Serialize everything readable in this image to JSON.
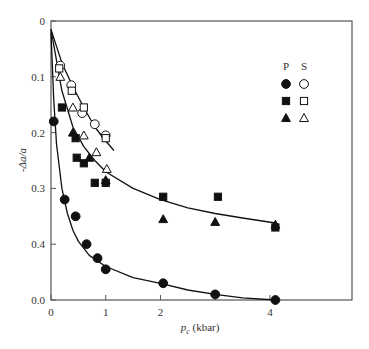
{
  "chart_data": {
    "type": "scatter",
    "title": "",
    "xlabel": "p_c (kbar)",
    "xlabel_main": "p",
    "xlabel_sub": "c",
    "xlabel_unit": " (kbar)",
    "ylabel": "-Δa/a",
    "xlim": [
      0,
      5.5
    ],
    "ylim": [
      0,
      0.5
    ],
    "y_inverted": true,
    "grid": false,
    "x_ticks": [
      0,
      1,
      2,
      3,
      4
    ],
    "x_tick_labels": [
      "0",
      "1",
      "2",
      "",
      "4"
    ],
    "y_ticks": [
      0,
      0.1,
      0.2,
      0.3,
      0.4,
      0.5
    ],
    "y_tick_labels": [
      "0",
      "0.1",
      "0.2",
      "0.3",
      "0.4",
      "0.0"
    ],
    "legend": {
      "position": "upper right",
      "columns": [
        "P",
        "S"
      ],
      "rows": [
        "circle",
        "square",
        "triangle"
      ]
    },
    "series": [
      {
        "name": "P circle",
        "marker": "circle",
        "filled": true,
        "x": [
          0.05,
          0.25,
          0.45,
          0.65,
          0.85,
          1.0,
          2.05,
          3.0,
          4.1
        ],
        "y": [
          0.18,
          0.32,
          0.35,
          0.4,
          0.425,
          0.445,
          0.47,
          0.49,
          0.5
        ]
      },
      {
        "name": "P square",
        "marker": "square",
        "filled": true,
        "x": [
          0.2,
          0.45,
          0.47,
          0.6,
          0.8,
          1.0,
          2.05,
          3.05,
          4.1
        ],
        "y": [
          0.155,
          0.21,
          0.245,
          0.255,
          0.29,
          0.29,
          0.315,
          0.315,
          0.37
        ]
      },
      {
        "name": "P triangle",
        "marker": "triangle",
        "filled": true,
        "x": [
          0.4,
          0.7,
          1.0,
          2.05,
          3.0,
          4.1
        ],
        "y": [
          0.2,
          0.245,
          0.285,
          0.355,
          0.36,
          0.365
        ]
      },
      {
        "name": "S circle",
        "marker": "circle",
        "filled": false,
        "x": [
          0.17,
          0.37,
          0.57,
          0.8,
          1.0
        ],
        "y": [
          0.08,
          0.115,
          0.165,
          0.185,
          0.205
        ]
      },
      {
        "name": "S square",
        "marker": "square",
        "filled": false,
        "x": [
          0.15,
          0.38,
          0.6,
          1.0
        ],
        "y": [
          0.085,
          0.125,
          0.155,
          0.21
        ]
      },
      {
        "name": "S triangle",
        "marker": "triangle",
        "filled": false,
        "x": [
          0.17,
          0.4,
          0.6,
          0.83,
          1.02
        ],
        "y": [
          0.1,
          0.155,
          0.205,
          0.235,
          0.265
        ]
      }
    ],
    "fit_curves": [
      {
        "name": "S fit",
        "x": [
          0,
          0.2,
          0.4,
          0.6,
          0.8,
          1.0,
          1.15
        ],
        "y": [
          0.015,
          0.075,
          0.118,
          0.155,
          0.19,
          0.215,
          0.232
        ]
      },
      {
        "name": "P square/triangle fit",
        "x": [
          0,
          0.2,
          0.4,
          0.6,
          0.8,
          1.0,
          1.5,
          2.0,
          2.5,
          3.0,
          3.5,
          4.1
        ],
        "y": [
          0.015,
          0.125,
          0.19,
          0.225,
          0.25,
          0.27,
          0.3,
          0.32,
          0.335,
          0.345,
          0.353,
          0.362
        ]
      },
      {
        "name": "P circle fit",
        "x": [
          0,
          0.05,
          0.1,
          0.2,
          0.3,
          0.4,
          0.5,
          0.7,
          1.0,
          1.5,
          2.0,
          2.5,
          3.0,
          3.5,
          4.1
        ],
        "y": [
          0.02,
          0.14,
          0.22,
          0.3,
          0.345,
          0.375,
          0.395,
          0.42,
          0.44,
          0.46,
          0.47,
          0.482,
          0.49,
          0.496,
          0.5
        ]
      }
    ]
  }
}
